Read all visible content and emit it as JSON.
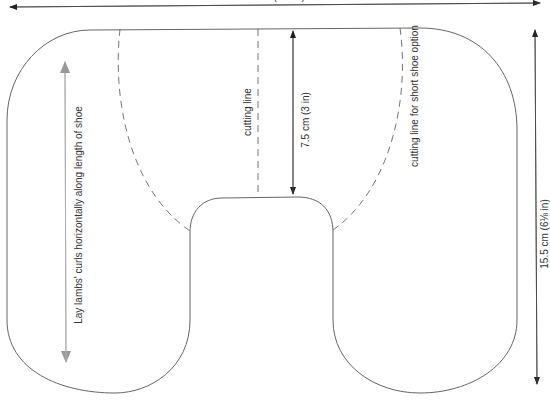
{
  "diagram": {
    "type": "sewing-pattern",
    "colors": {
      "outline": "#555555",
      "dashed": "#666666",
      "dimension_arrow": "#333333",
      "grain_arrow": "#aaaaaa",
      "text": "#333333"
    },
    "labels": {
      "width_dimension": "24.5 cm (9⅝ in)",
      "height_dimension": "15.5 cm (6⅛ in)",
      "notch_depth_dimension": "7.5 cm (3 in)",
      "cutting_line": "cutting line",
      "short_shoe_cutting_line": "cutting line for short shoe option",
      "grain_instruction": "Lay lambs' curls horizontally along length of shoe"
    }
  }
}
